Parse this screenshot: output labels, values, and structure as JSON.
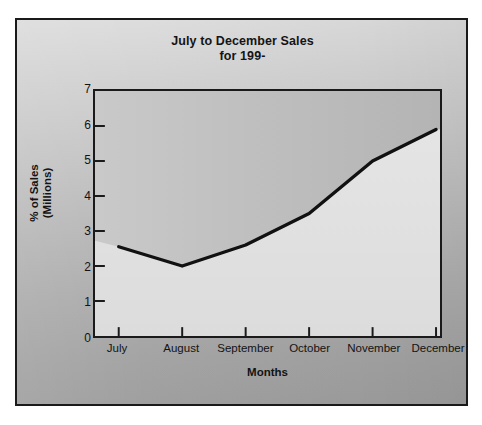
{
  "chart_data": {
    "type": "line",
    "title": "July to December Sales",
    "subtitle": "for 199-",
    "xlabel": "Months",
    "ylabel": "% of Sales",
    "ylabel_sub": "(Millions)",
    "categories": [
      "July",
      "August",
      "September",
      "October",
      "November",
      "December"
    ],
    "values": [
      2.55,
      2.0,
      2.6,
      3.5,
      5.0,
      5.9
    ],
    "series": [
      {
        "name": "% of Sales (Millions)",
        "values": [
          2.55,
          2.0,
          2.6,
          3.5,
          5.0,
          5.9
        ]
      }
    ],
    "ylim": [
      0,
      7
    ],
    "y_ticks": [
      "0",
      "1",
      "2",
      "3",
      "4",
      "5",
      "6",
      "7"
    ],
    "y_tick_values": [
      0,
      1,
      2,
      3,
      4,
      5,
      6,
      7
    ],
    "grid": false,
    "legend": "none",
    "line_color": "#111111",
    "area_fill_above": "#c2c2c2",
    "area_fill_below": "#e4e4e4",
    "plot_background": "#dedede",
    "frame_color": "#1a1a1a"
  }
}
